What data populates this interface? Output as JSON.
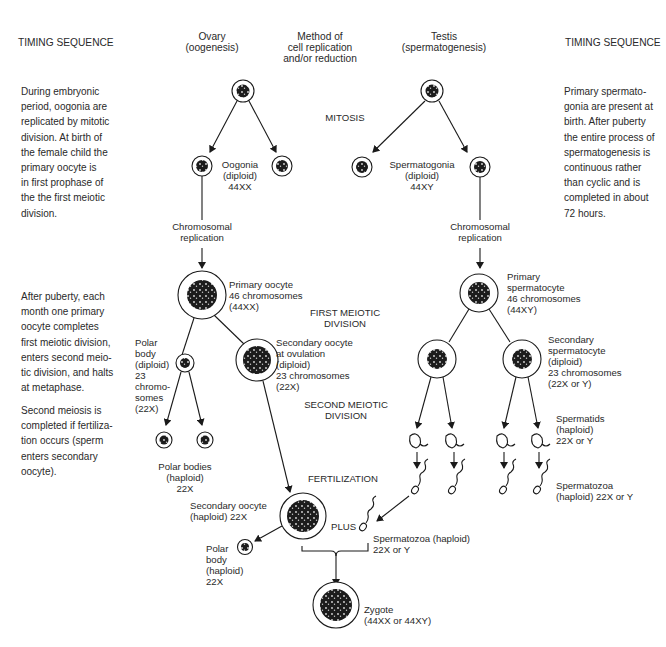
{
  "headers": {
    "timing_left": "TIMING SEQUENCE",
    "ovary": "Ovary\n(oogenesis)",
    "method": "Method of\ncell replication\nand/or reduction",
    "testis": "Testis\n(spermatogenesis)",
    "timing_right": "TIMING SEQUENCE"
  },
  "timing_left": {
    "embryonic": "During embryonic\nperiod, oogonia are\nreplicated by mitotic\ndivision. At birth of\nthe female child the\nprimary oocyte is\nin first prophase of\nthe the first meiotic\ndivision.",
    "puberty": "After puberty, each\nmonth one primary\noocyte completes\nfirst meiotic division,\nenters second meio-\ntic division, and halts\nat metaphase.",
    "second_meiosis": "Second meiosis is\ncompleted if fertiliza-\ntion occurs (sperm\nenters secondary\noocyte)."
  },
  "timing_right": {
    "spermatogonia": "Primary spermato-\ngonia are present at\nbirth. After puberty\nthe entire process of\nspermatogenesis is\ncontinuous rather\nthan cyclic and is\ncompleted in about\n72 hours."
  },
  "stages": {
    "mitosis": "MITOSIS",
    "first_meiotic": "FIRST MEIOTIC\nDIVISION",
    "second_meiotic": "SECOND MEIOTIC\nDIVISION",
    "fertilization": "FERTILIZATION"
  },
  "ovary_labels": {
    "oogonia": "Oogonia\n(diploid)\n44XX",
    "replication": "Chromosomal\nreplication",
    "primary_oocyte": "Primary oocyte\n46 chromosomes\n(44XX)",
    "polar_body_diploid": "Polar\nbody\n(diploid)\n23\nchromo-\nsomes\n(22X)",
    "secondary_oocyte_ovulation": "Secondary oocyte\nat ovulation\n(diploid)\n23 chromosomes\n(22X)",
    "polar_bodies_haploid": "Polar bodies\n(haploid)\n22X",
    "secondary_oocyte_haploid": "Secondary oocyte\n(haploid) 22X",
    "polar_body_haploid": "Polar\nbody\n(haploid)\n22X"
  },
  "testis_labels": {
    "spermatogonia": "Spermatogonia\n(diploid)\n44XY",
    "replication": "Chromosomal\nreplication",
    "primary_spermatocyte": "Primary\nspermatocyte\n46 chromosomes\n(44XY)",
    "secondary_spermatocyte": "Secondary\nspermatocyte\n(diploid)\n23 chromosomes\n(22X or Y)",
    "spermatids": "Spermatids\n(haploid)\n22X or Y",
    "spermatozoa": "Spermatozoa\n(haploid) 22X or Y"
  },
  "fertilization_labels": {
    "plus": "PLUS",
    "spermatozoa": "Spermatozoa (haploid)\n22X or Y",
    "zygote": "Zygote\n(44XX or 44XY)"
  }
}
